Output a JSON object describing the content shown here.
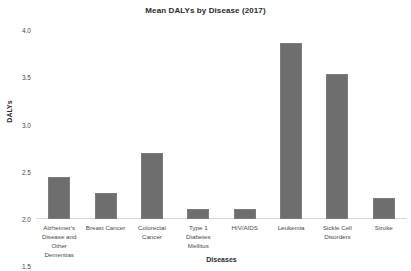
{
  "chart_data": {
    "type": "bar",
    "title": "Mean DALYs by Disease (2017)",
    "xlabel": "Diseases",
    "ylabel": "DALYs",
    "ylim": [
      0.0,
      4.0
    ],
    "yticks": [
      "4.0",
      "3.5",
      "3.0",
      "2.5",
      "2.0",
      "1.5",
      "1.0",
      "0.5",
      "0.0"
    ],
    "ytick_values": [
      4.0,
      3.5,
      3.0,
      2.5,
      2.0,
      1.5,
      1.0,
      0.5,
      0.0
    ],
    "grid": false,
    "legend": null,
    "bar_color": "#6e6e6e",
    "categories": [
      "Alzheimer's Disease and Other Dementias",
      "Breast Cancer",
      "Colorectal Cancer",
      "Type 1 Diabetes Mellitus",
      "HIV/AIDS",
      "Leukemia",
      "Sickle Cell Disorders",
      "Stroke"
    ],
    "category_lines": [
      [
        "Alzheimer's",
        "Disease and",
        "Other",
        "Dementias"
      ],
      [
        "Breast Cancer"
      ],
      [
        "Colorectal",
        "Cancer"
      ],
      [
        "Type 1",
        "Diabetes",
        "Mellitus"
      ],
      [
        "HIV/AIDS"
      ],
      [
        "Leukemia"
      ],
      [
        "Sickle Cell",
        "Disorders"
      ],
      [
        "Stroke"
      ]
    ],
    "values": [
      0.88,
      0.55,
      1.4,
      0.22,
      0.22,
      3.72,
      3.07,
      0.45
    ]
  }
}
